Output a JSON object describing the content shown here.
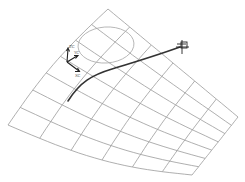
{
  "diagram": {
    "type": "cad-wireframe-surface",
    "colors": {
      "background": "#ffffff",
      "mesh": "#9a9a9a",
      "curve": "#333333",
      "axes": "#222222"
    },
    "surface": {
      "corners": {
        "top": [
          108,
          9
        ],
        "right": [
          238,
          117
        ],
        "bottom": [
          192,
          175
        ],
        "left": [
          8,
          125
        ]
      },
      "u_divisions": 6,
      "v_divisions": 7
    },
    "ellipse": {
      "cx": 106,
      "cy": 45,
      "rx": 28,
      "ry": 18
    },
    "curve": {
      "start": [
        68,
        101
      ],
      "end": [
        180,
        47
      ]
    },
    "coordinate_system": {
      "origin": [
        67,
        62
      ],
      "labels": {
        "z": "ZC",
        "y": "YC",
        "x": "XC"
      }
    },
    "endpoint_marker": {
      "x": 182,
      "y": 47
    }
  }
}
